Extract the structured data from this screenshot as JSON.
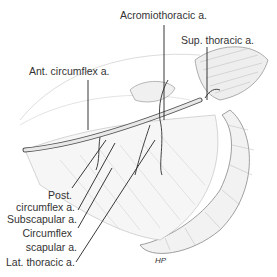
{
  "figure": {
    "labels": [
      {
        "id": "acromiothoracic",
        "text": "Acromiothoracic a."
      },
      {
        "id": "sup_thoracic",
        "text": "Sup. thoracic a."
      },
      {
        "id": "ant_circumflex",
        "text": "Ant. circumflex a."
      },
      {
        "id": "post_circumflex_1",
        "text": "Post."
      },
      {
        "id": "post_circumflex_2",
        "text": "circumflex a."
      },
      {
        "id": "subscapular",
        "text": "Subscapular a."
      },
      {
        "id": "circumflex_scapular_1",
        "text": "Circumflex"
      },
      {
        "id": "circumflex_scapular_2",
        "text": "scapular a."
      },
      {
        "id": "lat_thoracic",
        "text": "Lat. thoracic a."
      }
    ],
    "signature": "HP"
  }
}
